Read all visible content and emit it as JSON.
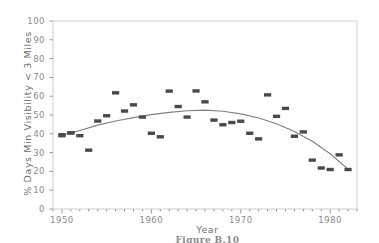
{
  "figure": {
    "caption": "Figure B.10",
    "background": "#ffffff"
  },
  "chart_data": {
    "type": "scatter",
    "title": "",
    "xlabel": "Year",
    "ylabel": "% Days Min Visibility < 3 Miles",
    "xlim": [
      1949,
      1983
    ],
    "ylim": [
      0,
      100
    ],
    "xticks": [
      1950,
      1960,
      1970,
      1980
    ],
    "xtick_labels": [
      "1950",
      "1960",
      "1970",
      "1980"
    ],
    "xminor_tick_step": 1,
    "yticks": [
      0,
      10,
      20,
      30,
      40,
      50,
      60,
      70,
      80,
      90,
      100
    ],
    "ytick_labels": [
      "0",
      "10",
      "20",
      "30",
      "40",
      "50",
      "60",
      "70",
      "80",
      "90",
      "100"
    ],
    "grid": false,
    "legend": "none",
    "marker_color": "#4a4a4a",
    "marker_shape": "rectangle",
    "curve_color": "#808080",
    "frame_color": "#cfcfcf",
    "x": [
      1950,
      1950,
      1951,
      1951,
      1952,
      1953,
      1954,
      1955,
      1956,
      1957,
      1958,
      1959,
      1960,
      1961,
      1962,
      1963,
      1964,
      1965,
      1966,
      1967,
      1968,
      1969,
      1970,
      1971,
      1972,
      1973,
      1974,
      1975,
      1976,
      1977,
      1978,
      1979,
      1980,
      1981,
      1982
    ],
    "y": [
      39.5,
      39.0,
      40.5,
      40.5,
      39.0,
      31.3,
      46.8,
      49.6,
      61.8,
      52.1,
      55.4,
      48.9,
      40.3,
      38.4,
      62.7,
      54.5,
      48.9,
      62.8,
      57.0,
      47.3,
      44.8,
      46.0,
      46.7,
      40.3,
      37.3,
      60.7,
      49.3,
      53.5,
      38.7,
      41.0,
      26.0,
      21.8,
      21.0,
      28.8,
      21.0
    ],
    "series_name": "% Days Min Visibility < 3 Miles",
    "fit": {
      "type": "quadratic",
      "label": "fitted trend curve",
      "x": [
        1950,
        1952,
        1954,
        1956,
        1958,
        1960,
        1962,
        1964,
        1966,
        1968,
        1970,
        1972,
        1974,
        1976,
        1978,
        1980,
        1982
      ],
      "y": [
        39.2,
        41.8,
        44.6,
        46.8,
        48.6,
        50.2,
        51.4,
        52.3,
        52.6,
        52.0,
        50.6,
        48.4,
        45.3,
        41.2,
        36.0,
        29.4,
        21.2
      ]
    }
  }
}
